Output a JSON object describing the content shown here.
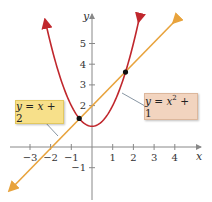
{
  "chart_data": {
    "type": "line",
    "title": "",
    "xlabel": "x",
    "ylabel": "y",
    "xlim": [
      -4,
      5
    ],
    "ylim": [
      -2,
      6
    ],
    "x_ticks": [
      -3,
      -2,
      -1,
      1,
      2,
      3,
      4
    ],
    "y_ticks": [
      -1,
      2,
      3,
      4,
      5
    ],
    "x_tick_labels": [
      "−3",
      "−2",
      "−1",
      "1",
      "2",
      "3",
      "4"
    ],
    "y_tick_labels": [
      "−1",
      "2",
      "3",
      "4",
      "5"
    ],
    "series": [
      {
        "name": "y = x + 2",
        "kind": "line",
        "color": "#e8a33c",
        "slope": 1,
        "intercept": 2
      },
      {
        "name": "y = x^2 + 1",
        "kind": "parabola",
        "color": "#c0272d",
        "a": 1,
        "b": 0,
        "c": 1
      }
    ],
    "intersections": [
      {
        "x": -0.618,
        "y": 1.382
      },
      {
        "x": 1.618,
        "y": 3.618
      }
    ],
    "annotations": [
      {
        "text": "y = x + 2",
        "box_color": "#f7e08a"
      },
      {
        "text": "y = x² + 1",
        "box_color": "#f2d4bf"
      }
    ]
  },
  "labels": {
    "x_axis": "x",
    "y_axis": "y",
    "line_eq": {
      "y": "y",
      "eq": " = ",
      "x": "x",
      "rest": " + 2"
    },
    "parabola_eq": {
      "y": "y",
      "eq": " = ",
      "x": "x",
      "exp": "2",
      "rest": " + 1"
    }
  },
  "colors": {
    "line": "#e8a33c",
    "parabola": "#c0272d",
    "axis": "#888888",
    "line_box": "#f7e08a",
    "parabola_box": "#f2d4bf"
  }
}
